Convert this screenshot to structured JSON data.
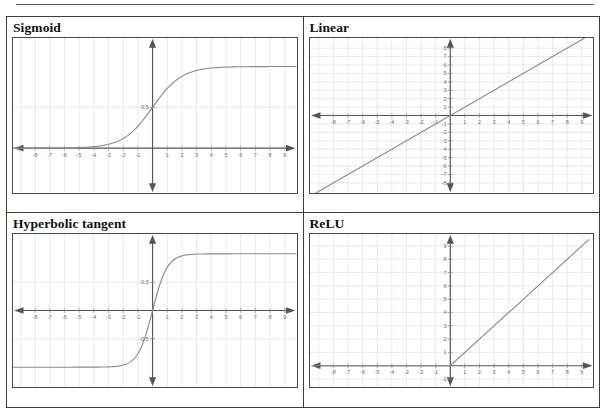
{
  "document": {
    "top_rule": true
  },
  "panels": [
    {
      "id": "sigmoid",
      "title": "Sigmoid"
    },
    {
      "id": "linear",
      "title": "Linear"
    },
    {
      "id": "tanh",
      "title": "Hyperbolic tangent"
    },
    {
      "id": "relu",
      "title": "ReLU"
    }
  ],
  "chart_data": [
    {
      "type": "line",
      "title": "Sigmoid",
      "xlabel": "",
      "ylabel": "",
      "xlim": [
        -9.5,
        9.8
      ],
      "ylim": [
        -0.55,
        1.35
      ],
      "grid": true,
      "legend": "none",
      "xticks": [
        -8,
        -7,
        -6,
        -5,
        -4,
        -3,
        -2,
        -1,
        1,
        2,
        3,
        4,
        5,
        6,
        7,
        8,
        9
      ],
      "xtick_labels": [
        "-8",
        "-7",
        "-6",
        "-5",
        "-4",
        "-3",
        "-2",
        "-1",
        "1",
        "2",
        "3",
        "4",
        "5",
        "6",
        "7",
        "8",
        "9"
      ],
      "yticks": [
        0.5
      ],
      "ytick_labels": [
        "0.5"
      ],
      "series": [
        {
          "name": "sigmoid",
          "formula": "1 / (1 + exp(-x))",
          "x": [
            -9.5,
            -9,
            -8,
            -7,
            -6,
            -5,
            -4,
            -3,
            -2.5,
            -2,
            -1.5,
            -1,
            -0.5,
            0,
            0.5,
            1,
            1.5,
            2,
            2.5,
            3,
            4,
            5,
            6,
            7,
            8,
            9,
            9.8
          ],
          "y": [
            0.0001,
            0.0001,
            0.0003,
            0.0009,
            0.0025,
            0.0067,
            0.018,
            0.047,
            0.076,
            0.119,
            0.182,
            0.269,
            0.378,
            0.5,
            0.622,
            0.731,
            0.818,
            0.881,
            0.924,
            0.953,
            0.982,
            0.993,
            0.998,
            0.999,
            1.0,
            1.0,
            1.0
          ]
        }
      ]
    },
    {
      "type": "line",
      "title": "Linear",
      "xlabel": "",
      "ylabel": "",
      "xlim": [
        -9.6,
        9.8
      ],
      "ylim": [
        -9.2,
        9.2
      ],
      "grid": true,
      "legend": "none",
      "xticks": [
        -8,
        -7,
        -6,
        -5,
        -4,
        -3,
        -2,
        -1,
        1,
        2,
        3,
        4,
        5,
        6,
        7,
        8,
        9
      ],
      "xtick_labels": [
        "-8",
        "-7",
        "-6",
        "-5",
        "-4",
        "-3",
        "-2",
        "-1",
        "1",
        "2",
        "3",
        "4",
        "5",
        "6",
        "7",
        "8",
        "9"
      ],
      "yticks": [
        8,
        7,
        6,
        5,
        4,
        3,
        2,
        1,
        -1,
        -2,
        -3,
        -4,
        -5,
        -6,
        -7,
        -8
      ],
      "ytick_labels": [
        "8",
        "7",
        "6",
        "5",
        "4",
        "3",
        "2",
        "1",
        "-1",
        "-2",
        "-3",
        "-4",
        "-5",
        "-6",
        "-7",
        "-8"
      ],
      "series": [
        {
          "name": "linear",
          "formula": "y = x",
          "x": [
            -9.2,
            9.2
          ],
          "y": [
            -9.2,
            9.2
          ]
        }
      ]
    },
    {
      "type": "line",
      "title": "Hyperbolic tangent",
      "xlabel": "",
      "ylabel": "",
      "xlim": [
        -9.5,
        9.8
      ],
      "ylim": [
        -1.35,
        1.35
      ],
      "grid": true,
      "legend": "none",
      "xticks": [
        -8,
        -7,
        -6,
        -5,
        -4,
        -3,
        -2,
        -1,
        1,
        2,
        3,
        4,
        5,
        6,
        7,
        8,
        9
      ],
      "xtick_labels": [
        "-8",
        "-7",
        "-6",
        "-5",
        "-4",
        "-3",
        "-2",
        "-1",
        "1",
        "2",
        "3",
        "4",
        "5",
        "6",
        "7",
        "8",
        "9"
      ],
      "yticks": [
        0.5,
        -0.5
      ],
      "ytick_labels": [
        "0.5",
        "-0.5"
      ],
      "series": [
        {
          "name": "tanh",
          "formula": "tanh(x)",
          "x": [
            -9.5,
            -8,
            -6,
            -5,
            -4,
            -3,
            -2.5,
            -2,
            -1.5,
            -1,
            -0.5,
            0,
            0.5,
            1,
            1.5,
            2,
            2.5,
            3,
            4,
            5,
            6,
            8,
            9.8
          ],
          "y": [
            -1.0,
            -1.0,
            -1.0,
            -0.9999,
            -0.9993,
            -0.995,
            -0.987,
            -0.964,
            -0.905,
            -0.762,
            -0.462,
            0,
            0.462,
            0.762,
            0.905,
            0.964,
            0.987,
            0.995,
            0.9993,
            0.9999,
            1.0,
            1.0,
            1.0
          ]
        }
      ]
    },
    {
      "type": "line",
      "title": "ReLU",
      "xlabel": "",
      "ylabel": "",
      "xlim": [
        -9.6,
        9.8
      ],
      "ylim": [
        -1.6,
        9.9
      ],
      "grid": true,
      "legend": "none",
      "xticks": [
        -8,
        -7,
        -6,
        -5,
        -4,
        -3,
        -2,
        -1,
        1,
        2,
        3,
        4,
        5,
        6,
        7,
        8,
        9
      ],
      "xtick_labels": [
        "-8",
        "-7",
        "-6",
        "-5",
        "-4",
        "-3",
        "-2",
        "-1",
        "1",
        "2",
        "3",
        "4",
        "5",
        "6",
        "7",
        "8",
        "9"
      ],
      "yticks": [
        9,
        8,
        7,
        6,
        5,
        4,
        3,
        2,
        1,
        -1
      ],
      "ytick_labels": [
        "9",
        "8",
        "7",
        "6",
        "5",
        "4",
        "3",
        "2",
        "1",
        "-1"
      ],
      "series": [
        {
          "name": "relu",
          "formula": "max(0, x)",
          "x": [
            -9.5,
            0,
            9.5
          ],
          "y": [
            0,
            0,
            9.5
          ]
        }
      ]
    }
  ],
  "style": {
    "curve_color": "#8a8a8a",
    "axis_color": "#555555",
    "grid_color": "#dcdce4",
    "tick_color": "#8a8a8a",
    "label_color": "#6f6f6f",
    "border_color": "#3d3d3d",
    "title_color": "#111111"
  }
}
